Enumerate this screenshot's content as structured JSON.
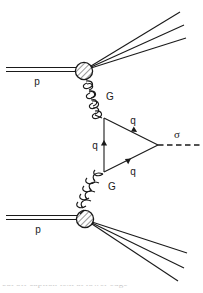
{
  "figure": {
    "type": "feynman-diagram",
    "background_color": "#ffffff",
    "line_color": "#1a1a1a"
  },
  "labels": {
    "proton_top": "p",
    "proton_bottom": "p",
    "gluon_top": "G",
    "gluon_bottom": "G",
    "quark_left": "q",
    "quark_upper": "q",
    "quark_lower": "q",
    "sigma": "σ"
  },
  "nodes": {
    "blob_top": {
      "cx": 84,
      "cy": 71,
      "r": 9,
      "style": "hatched-circle"
    },
    "blob_bottom": {
      "cx": 85,
      "cy": 219,
      "r": 9,
      "style": "hatched-circle"
    },
    "vertex_upper": {
      "x": 105,
      "y": 118
    },
    "vertex_lower": {
      "x": 105,
      "y": 172
    },
    "vertex_sigma": {
      "x": 158,
      "y": 145
    }
  },
  "caption": {
    "partial_text": "cut off caption text at lower edge"
  }
}
